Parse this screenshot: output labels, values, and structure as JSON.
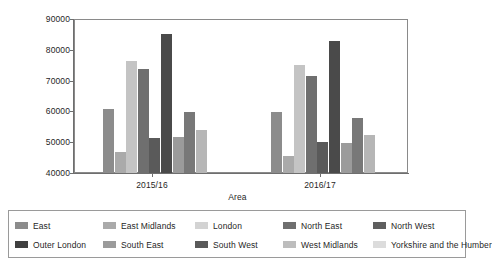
{
  "chart_data": {
    "type": "bar",
    "title": "",
    "xlabel": "Area",
    "ylabel": "",
    "ylim": [
      40000,
      90000
    ],
    "yticks": [
      40000,
      50000,
      60000,
      70000,
      80000,
      90000
    ],
    "ytick_labels": [
      "40000",
      "50000",
      "60000",
      "70000",
      "80000",
      "90000"
    ],
    "grid": false,
    "legend_position": "bottom",
    "categories": [
      "2015/16",
      "2016/17"
    ],
    "series": [
      {
        "name": "East",
        "color": "#8c8c8c",
        "values": [
          60800,
          59800
        ]
      },
      {
        "name": "East Midlands",
        "color": "#aaaaaa",
        "values": [
          46800,
          45500
        ]
      },
      {
        "name": "London",
        "color": "#c4c4c4",
        "values": [
          76500,
          75200
        ]
      },
      {
        "name": "North East",
        "color": "#6f6f6f",
        "values": [
          74000,
          71800
        ]
      },
      {
        "name": "North West",
        "color": "#5a5a5a",
        "values": [
          51600,
          50100
        ]
      },
      {
        "name": "Outer London",
        "color": "#4a4a4a",
        "values": [
          85300,
          83300
        ]
      },
      {
        "name": "South East",
        "color": "#9b9b9b",
        "values": [
          51800,
          49900
        ]
      },
      {
        "name": "South West",
        "color": "#787878",
        "values": [
          60000,
          58000
        ]
      },
      {
        "name": "West Midlands",
        "color": "#b6b6b6",
        "values": [
          54000,
          52400
        ]
      },
      {
        "name": "Yorkshire and the Humber",
        "color": "#d0d0d0",
        "values": [
          54000,
          52400
        ]
      }
    ]
  },
  "axis": {
    "x_title": "Area",
    "x_tick_labels": [
      "2015/16",
      "2016/17"
    ],
    "y_tick_labels": [
      "90000",
      "80000",
      "70000",
      "60000",
      "50000",
      "40000"
    ]
  },
  "legend": {
    "entries": [
      {
        "label": "East",
        "color": "#8c8c8c"
      },
      {
        "label": "East Midlands",
        "color": "#aaaaaa"
      },
      {
        "label": "London",
        "color": "#d3d3d3"
      },
      {
        "label": "North East",
        "color": "#6f6f6f"
      },
      {
        "label": "North West",
        "color": "#5f5f5f"
      },
      {
        "label": "Outer London",
        "color": "#404040"
      },
      {
        "label": "South East",
        "color": "#9b9b9b"
      },
      {
        "label": "South West",
        "color": "#5a5a5a"
      },
      {
        "label": "West Midlands",
        "color": "#bdbdbd"
      },
      {
        "label": "Yorkshire and the Humber",
        "color": "#dcdcdc"
      }
    ]
  }
}
